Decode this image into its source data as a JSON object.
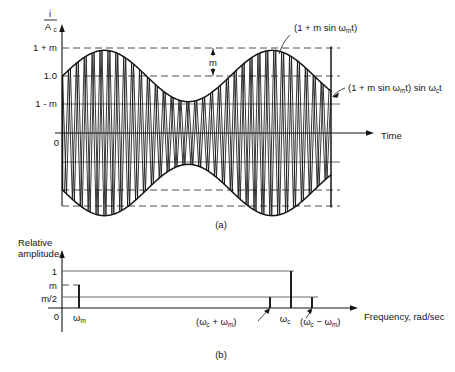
{
  "figure": {
    "panels": [
      {
        "id": "a",
        "caption": "(a)"
      },
      {
        "id": "b",
        "caption": "(b)"
      }
    ]
  },
  "panel_a": {
    "caption": "(a)",
    "y_axis_label_num": "i",
    "y_axis_label_den": "A",
    "y_axis_label_den_sub": "c",
    "x_axis_label": "Time",
    "y_ticks": [
      "1 + m",
      "1.0",
      "1 - m",
      "0"
    ],
    "depth_marker": "m",
    "annotation_envelope": "(1 + m sin ω",
    "annotation_envelope_sub": "m",
    "annotation_envelope_tail": "t)",
    "annotation_signal_a": "(1 + m sin ω",
    "annotation_signal_sub1": "m",
    "annotation_signal_b": "t) sin ω",
    "annotation_signal_sub2": "c",
    "annotation_signal_tail": "t"
  },
  "panel_b": {
    "caption": "(b)",
    "y_axis_label_line1": "Relative",
    "y_axis_label_line2": "amplitude",
    "x_axis_label": "Frequency, rad/sec",
    "y_ticks": [
      "1",
      "m",
      "m/2",
      "0"
    ],
    "x_tick_modulating": "ω",
    "x_tick_modulating_sub": "m",
    "x_tick_upper_open": "(ω",
    "x_tick_upper_sub1": "c",
    "x_tick_upper_mid": " + ω",
    "x_tick_upper_sub2": "m",
    "x_tick_upper_close": ")",
    "x_tick_carrier": "ω",
    "x_tick_carrier_sub": "c",
    "x_tick_lower_open": "(ω",
    "x_tick_lower_sub1": "c",
    "x_tick_lower_mid": " − ω",
    "x_tick_lower_sub2": "m",
    "x_tick_lower_close": ")"
  },
  "chart_data": [
    {
      "type": "line",
      "id": "panel-a-am-waveform",
      "title": "(a) Amplitude modulated carrier in the time domain",
      "xlabel": "Time",
      "ylabel": "i / A_c",
      "grid": true,
      "legend_position": "annotations",
      "xlim": [
        0,
        1
      ],
      "ylim": [
        -1.45,
        1.45
      ],
      "modulation_index_m": 0.45,
      "carrier_cycles": 34,
      "modulating_cycles": 1.6,
      "ytick_values": [
        1.45,
        1.0,
        0.55,
        0.0,
        -0.55,
        -1.0,
        -1.45
      ],
      "ytick_labels": [
        "1 + m",
        "1.0",
        "1 - m",
        "0",
        "",
        "",
        ""
      ],
      "series": [
        {
          "name": "(1 + m sin ωm t)",
          "role": "upper-envelope",
          "expression": "1 + m*sin(wm*t)"
        },
        {
          "name": "-(1 + m sin ωm t)",
          "role": "lower-envelope",
          "expression": "-(1 + m*sin(wm*t))"
        },
        {
          "name": "(1 + m sin ωm t) sin ωc t",
          "role": "modulated-carrier",
          "expression": "(1 + m*sin(wm*t))*sin(wc*t)"
        }
      ],
      "annotations": [
        {
          "text": "(1 + m sin ωm t)",
          "points_to": "upper envelope"
        },
        {
          "text": "(1 + m sin ωm t) sin ωc t",
          "points_to": "carrier waveform"
        },
        {
          "text": "m",
          "points_to": "depth between 1.0 and 1 + m"
        }
      ]
    },
    {
      "type": "bar",
      "id": "panel-b-spectrum",
      "title": "(b) Frequency spectrum of the AM signal",
      "xlabel": "Frequency, rad/sec",
      "ylabel": "Relative amplitude",
      "grid": true,
      "legend_position": "none",
      "ylim": [
        0,
        1.15
      ],
      "ytick_values": [
        1.0,
        0.45,
        0.225,
        0.0
      ],
      "ytick_labels": [
        "1",
        "m",
        "m/2",
        "0"
      ],
      "categories": [
        "ωm",
        "(ωc + ωm)",
        "ωc",
        "(ωc − ωm)"
      ],
      "values": [
        0.45,
        0.225,
        1.0,
        0.225
      ],
      "value_labels": [
        "m",
        "m/2",
        "1",
        "m/2"
      ]
    }
  ]
}
